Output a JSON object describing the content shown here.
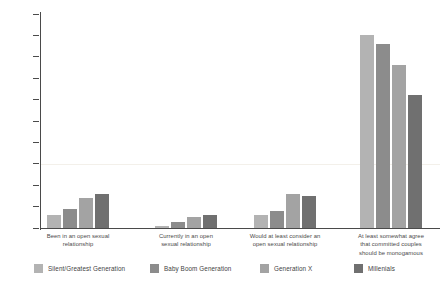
{
  "chart_data": {
    "type": "bar",
    "title": "",
    "subtitle": "",
    "xlabel": "",
    "ylabel": "",
    "ylim": [
      0,
      100
    ],
    "yticks": [
      0,
      10,
      20,
      30,
      40,
      50,
      60,
      70,
      80,
      90,
      100
    ],
    "ytick_labels": [
      "0",
      "10",
      "20",
      "30",
      "40",
      "50",
      "60",
      "70",
      "80",
      "90",
      "100"
    ],
    "grid": false,
    "legend_position": "bottom",
    "categories": [
      "Been in an open sexual relationship",
      "Currently in an open sexual relationship",
      "Would at least consider an open sexual relationship",
      "At least somewhat agree that committed couples should be monogamous"
    ],
    "category_lines": [
      [
        "Been in an open sexual",
        "relationship"
      ],
      [
        "Currently in an open",
        "sexual relationship"
      ],
      [
        "Would at least consider an",
        "open sexual relationship"
      ],
      [
        "At least somewhat agree",
        "that committed couples",
        "should be monogamous"
      ]
    ],
    "series": [
      {
        "name": "Silent/Greatest Generation",
        "color": "#b3b3b3",
        "values": [
          6,
          1,
          6,
          90
        ]
      },
      {
        "name": "Baby Boom Generation",
        "color": "#8c8c8c",
        "values": [
          9,
          3,
          8,
          86
        ]
      },
      {
        "name": "Generation X",
        "color": "#a3a3a3",
        "values": [
          14,
          5,
          16,
          76
        ]
      },
      {
        "name": "Millenials",
        "color": "#707070",
        "values": [
          16,
          6,
          15,
          62
        ]
      }
    ]
  },
  "legend": {
    "items": [
      {
        "label": "Silent/Greatest Generation",
        "color": "#b3b3b3",
        "left": 0
      },
      {
        "label": "Baby Boom Generation",
        "color": "#8c8c8c",
        "left": 116
      },
      {
        "label": "Generation X",
        "color": "#a3a3a3",
        "left": 226
      },
      {
        "label": "Millenials",
        "color": "#707070",
        "left": 320
      }
    ]
  },
  "axes": {
    "y_axis_color": "#4a4a4a",
    "x_axis_color": "#4a4a4a"
  }
}
